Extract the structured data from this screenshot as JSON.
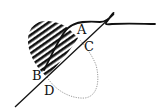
{
  "diagram": {
    "type": "geometric-figure",
    "labels": {
      "A": "A",
      "B": "B",
      "C": "C",
      "D": "D"
    },
    "elements": [
      "hatched-lobe",
      "dotted-ellipse-arc",
      "straight-secant-line",
      "thick-curve"
    ],
    "colors": {
      "ink": "#111111",
      "dotted": "#9a9a9a",
      "background": "#ffffff"
    }
  }
}
